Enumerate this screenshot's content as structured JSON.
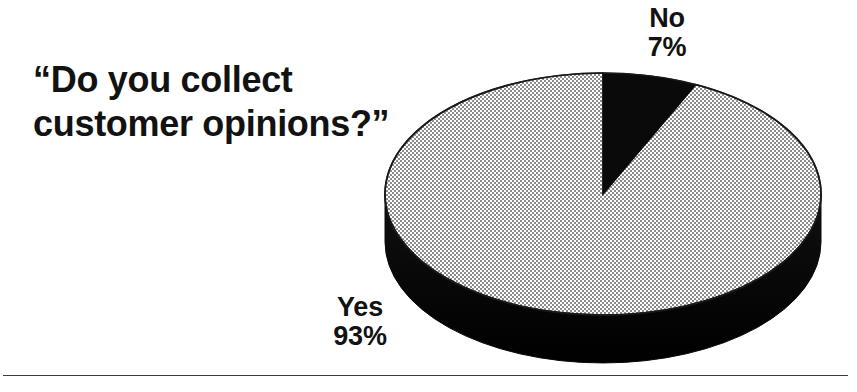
{
  "page": {
    "background_color": "#ffffff",
    "width": 857,
    "height": 392
  },
  "title": {
    "text": "“Do you collect\ncustomer opinions?”",
    "color": "#121212"
  },
  "labels": {
    "no": "No\n7%",
    "yes": "Yes\n93%"
  },
  "footer": {
    "rule_color": "#3a3a3a"
  },
  "chart_data": {
    "type": "pie",
    "title": "“Do you collect customer opinions?”",
    "style": "3d-exploded-none",
    "start_angle_deg": 0,
    "direction": "clockwise",
    "legend": "none",
    "data_labels": true,
    "grid": false,
    "geometry": {
      "center_x": 603,
      "center_y": 194,
      "radius_x": 218,
      "radius_y": 121,
      "depth": 48
    },
    "slices": [
      {
        "label": "No",
        "value": 7,
        "unit": "%",
        "color": "#0a0a0a",
        "fill": "solid-black",
        "label_text": "No\n7%",
        "label_position": "outside-top-right"
      },
      {
        "label": "Yes",
        "value": 93,
        "unit": "%",
        "color": "#c4c4c4",
        "fill": "halftone-gray-dither",
        "label_text": "Yes\n93%",
        "label_position": "outside-bottom-left"
      }
    ],
    "labels_all": [
      "No",
      "Yes"
    ],
    "values_all": [
      7,
      93
    ],
    "colors_all": [
      "#0a0a0a",
      "#c4c4c4"
    ],
    "side_wall_color": "#0a0a0a",
    "outline_color": "#1a1a1a"
  }
}
